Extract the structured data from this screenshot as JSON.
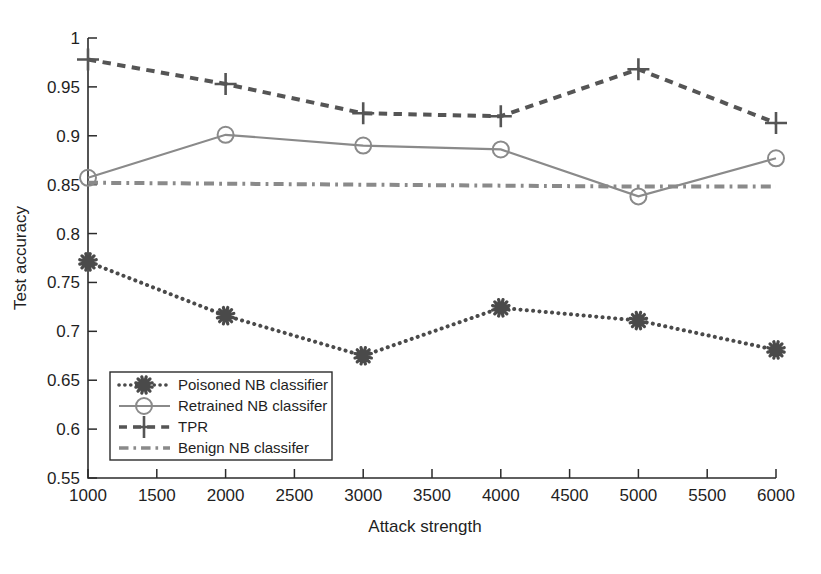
{
  "chart_data": {
    "type": "line",
    "title": "",
    "xlabel": "Attack strength",
    "ylabel": "Test accuracy",
    "xlim": [
      1000,
      6000
    ],
    "ylim": [
      0.55,
      1.0
    ],
    "xticks": [
      1000,
      1500,
      2000,
      2500,
      3000,
      3500,
      4000,
      4500,
      5000,
      5500,
      6000
    ],
    "xtick_labels": [
      "1000",
      "1500",
      "2000",
      "2500",
      "3000",
      "3500",
      "4000",
      "4500",
      "5000",
      "5500",
      "6000"
    ],
    "yticks": [
      0.55,
      0.6,
      0.65,
      0.7,
      0.75,
      0.8,
      0.85,
      0.9,
      0.95,
      1
    ],
    "ytick_labels": [
      "0.55",
      "0.6",
      "0.65",
      "0.7",
      "0.75",
      "0.8",
      "0.85",
      "0.9",
      "0.95",
      "1"
    ],
    "grid": false,
    "legend_position": "lower-left",
    "x": [
      1000,
      2000,
      3000,
      4000,
      5000,
      6000
    ],
    "series": [
      {
        "name": "Poisoned NB classifier",
        "values": [
          0.771,
          0.716,
          0.675,
          0.724,
          0.711,
          0.681
        ],
        "color": "#4a4a4a",
        "linestyle": "dotted",
        "marker": "asterisk"
      },
      {
        "name": "Retrained NB classifer",
        "values": [
          0.857,
          0.901,
          0.89,
          0.886,
          0.838,
          0.877
        ],
        "color": "#8a8a8a",
        "linestyle": "solid",
        "marker": "circle"
      },
      {
        "name": "TPR",
        "values": [
          0.978,
          0.953,
          0.923,
          0.92,
          0.968,
          0.913
        ],
        "color": "#555555",
        "linestyle": "dashed",
        "marker": "plus"
      },
      {
        "name": "Benign NB classifer",
        "values": [
          0.852,
          0.851,
          0.85,
          0.849,
          0.848,
          0.848
        ],
        "color": "#8a8a8a",
        "linestyle": "dashdot",
        "marker": "none"
      }
    ]
  },
  "legend": {
    "items": [
      {
        "label": "Poisoned NB classifier"
      },
      {
        "label": "Retrained NB classifer"
      },
      {
        "label": "TPR"
      },
      {
        "label": "Benign NB classifer"
      }
    ]
  }
}
